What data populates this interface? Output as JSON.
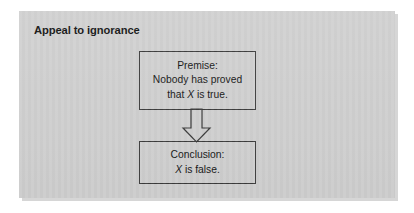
{
  "figure": {
    "title": "Appeal to ignorance",
    "panel_color": "#d1d1d1",
    "stroke_color": "#3a3a3a",
    "text_color": "#161616"
  },
  "diagram": {
    "type": "flowchart",
    "direction": "top-to-bottom",
    "nodes": [
      {
        "id": "premise",
        "label": "Premise",
        "lines": [
          {
            "text": "Premise:",
            "italic_token": ""
          },
          {
            "text": "Nobody has proved",
            "italic_token": ""
          },
          {
            "before": "that ",
            "italic_token": "X",
            "after": " is true."
          }
        ]
      },
      {
        "id": "conclusion",
        "label": "Conclusion",
        "lines": [
          {
            "text": "Conclusion:",
            "italic_token": ""
          },
          {
            "before": "",
            "italic_token": "X",
            "after": " is false."
          }
        ]
      }
    ],
    "connector": {
      "id": "premise-to-conclusion",
      "shape": "hollow-block-arrow",
      "direction": "down"
    }
  }
}
